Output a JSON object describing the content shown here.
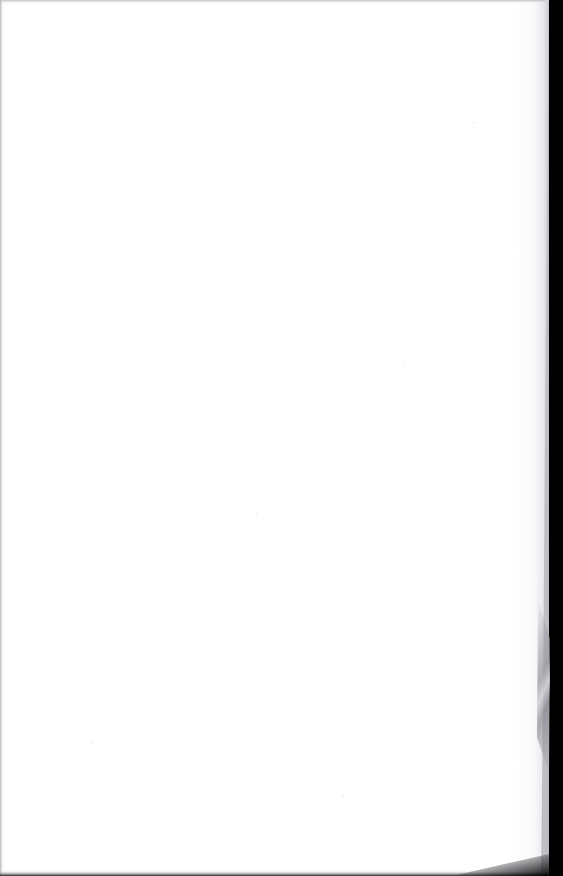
{
  "page": {
    "kind": "scanned-page",
    "content_state": "blank",
    "visible_text": "",
    "accessible_description": "Blank scanned page"
  },
  "colors": {
    "paper": "#ffffff",
    "scan_backdrop": "#000000",
    "edge_shadow": "#18181a",
    "curl_highlight": "#cecfd5",
    "soft_falloff": "#c6c7cc"
  },
  "geometry": {
    "width": 563,
    "height": 876,
    "paper_right_edge_top": 545,
    "paper_right_edge_bottom": 541,
    "backdrop_band_width": 26
  },
  "artifacts": {
    "specks": [
      {
        "x": 187,
        "y": 207,
        "size": 2
      },
      {
        "x": 404,
        "y": 361,
        "size": 2
      },
      {
        "x": 256,
        "y": 513,
        "size": 2
      },
      {
        "x": 91,
        "y": 742,
        "size": 2
      },
      {
        "x": 342,
        "y": 795,
        "size": 2
      },
      {
        "x": 473,
        "y": 122,
        "size": 2
      }
    ]
  }
}
